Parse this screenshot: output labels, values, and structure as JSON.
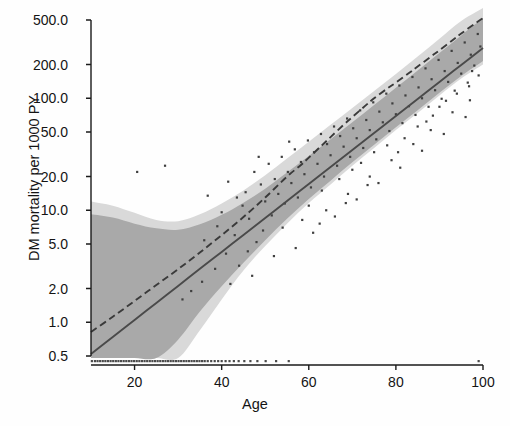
{
  "chart_data": {
    "type": "scatter",
    "title": "",
    "xlabel": "Age",
    "ylabel": "DM mortality per 1000 PY",
    "xlim": [
      10,
      100
    ],
    "ylim": [
      0.42,
      700
    ],
    "yscale": "log",
    "grid": false,
    "legend": null,
    "xticks": [
      20,
      40,
      60,
      80,
      100
    ],
    "xticklabels": [
      "20",
      "40",
      "60",
      "80",
      "100"
    ],
    "yticks": [
      0.5,
      1.0,
      2.0,
      5.0,
      10.0,
      20.0,
      50.0,
      100.0,
      200.0,
      500.0
    ],
    "yticklabels": [
      "0.5",
      "1.0",
      "2.0",
      "5.0",
      "10.0",
      "20.0",
      "50.0",
      "100.0",
      "200.0",
      "500.0"
    ],
    "series": [
      {
        "name": "linear-fit",
        "type": "line",
        "style": "solid",
        "color": "#4a4a4a",
        "x": [
          10,
          15,
          20,
          25,
          30,
          35,
          40,
          45,
          50,
          55,
          60,
          65,
          70,
          75,
          80,
          85,
          90,
          95,
          100
        ],
        "y": [
          0.52,
          0.74,
          1.05,
          1.49,
          2.11,
          3.0,
          4.25,
          6.03,
          8.55,
          12.1,
          17.2,
          24.4,
          34.6,
          49.1,
          69.6,
          98.7,
          140.0,
          198.5,
          281.5
        ]
      },
      {
        "name": "spline-fit",
        "type": "line",
        "style": "dashed",
        "color": "#3a3a3a",
        "x": [
          10,
          15,
          20,
          25,
          30,
          35,
          40,
          45,
          50,
          55,
          58,
          60,
          63,
          65,
          68,
          70,
          73,
          75,
          78,
          80,
          83,
          85,
          88,
          90,
          93,
          95,
          98,
          100
        ],
        "y": [
          0.82,
          1.12,
          1.55,
          2.15,
          2.98,
          4.2,
          6.0,
          8.7,
          13.0,
          20.0,
          25.0,
          29.5,
          38.0,
          45.0,
          58.0,
          68.0,
          86.0,
          100.0,
          122.0,
          138.0,
          168.0,
          192.0,
          235.0,
          268.0,
          330.0,
          378.0,
          460.0,
          520.0
        ]
      },
      {
        "name": "ci-band-outer",
        "type": "band",
        "color": "#d9d9d9",
        "x": [
          10,
          15,
          20,
          25,
          30,
          35,
          40,
          45,
          50,
          55,
          60,
          65,
          70,
          75,
          80,
          85,
          90,
          95,
          100
        ],
        "ylow": [
          0.42,
          0.42,
          0.42,
          0.42,
          0.45,
          0.85,
          1.6,
          2.9,
          4.8,
          7.6,
          11.6,
          17.0,
          25.0,
          36.0,
          52.0,
          74.0,
          106.0,
          150.0,
          200.0
        ],
        "yhigh": [
          12.0,
          11.0,
          9.5,
          8.2,
          8.0,
          9.2,
          11.5,
          15.0,
          20.5,
          29.0,
          41.0,
          58.0,
          82.0,
          116.0,
          165.0,
          236.0,
          340.0,
          490.0,
          700.0
        ]
      },
      {
        "name": "ci-band-inner",
        "type": "band",
        "color": "#a9a9a9",
        "x": [
          10,
          15,
          20,
          25,
          30,
          35,
          40,
          45,
          50,
          55,
          60,
          65,
          70,
          75,
          80,
          85,
          90,
          95,
          100
        ],
        "ylow": [
          0.42,
          0.42,
          0.42,
          0.42,
          0.7,
          1.25,
          2.1,
          3.4,
          5.4,
          8.4,
          12.6,
          18.4,
          26.8,
          38.5,
          55.0,
          78.0,
          112.0,
          158.0,
          215.0
        ],
        "yhigh": [
          9.2,
          8.6,
          7.6,
          6.9,
          6.7,
          7.5,
          9.1,
          11.7,
          15.6,
          21.8,
          30.5,
          43.0,
          61.0,
          87.0,
          124.0,
          177.0,
          254.0,
          364.0,
          520.0
        ]
      },
      {
        "name": "observations",
        "type": "scatter",
        "color": "#3f3f3f",
        "marker": "point",
        "points": [
          [
            20.6,
            22.0
          ],
          [
            27.0,
            25.0
          ],
          [
            36.8,
            13.5
          ],
          [
            39.0,
            7.2
          ],
          [
            40.0,
            9.6
          ],
          [
            41.5,
            18.0
          ],
          [
            43.0,
            6.0
          ],
          [
            44.8,
            11.0
          ],
          [
            45.5,
            14.5
          ],
          [
            46.3,
            8.4
          ],
          [
            47.5,
            22.0
          ],
          [
            48.0,
            5.2
          ],
          [
            49.0,
            17.0
          ],
          [
            50.0,
            12.0
          ],
          [
            50.8,
            26.0
          ],
          [
            51.5,
            9.0
          ],
          [
            52.2,
            19.0
          ],
          [
            53.0,
            14.0
          ],
          [
            53.8,
            30.0
          ],
          [
            54.5,
            11.5
          ],
          [
            55.2,
            22.0
          ],
          [
            56.0,
            17.5
          ],
          [
            56.8,
            35.0
          ],
          [
            57.5,
            13.0
          ],
          [
            58.2,
            27.0
          ],
          [
            59.0,
            21.0
          ],
          [
            59.8,
            42.0
          ],
          [
            60.5,
            16.0
          ],
          [
            61.2,
            33.0
          ],
          [
            62.0,
            26.0
          ],
          [
            62.8,
            48.0
          ],
          [
            63.5,
            20.0
          ],
          [
            64.2,
            39.0
          ],
          [
            65.0,
            31.0
          ],
          [
            65.8,
            56.0
          ],
          [
            66.5,
            25.0
          ],
          [
            67.2,
            46.0
          ],
          [
            68.0,
            37.0
          ],
          [
            68.8,
            66.0
          ],
          [
            69.5,
            30.0
          ],
          [
            70.2,
            54.0
          ],
          [
            71.0,
            44.0
          ],
          [
            71.8,
            78.0
          ],
          [
            72.5,
            36.0
          ],
          [
            73.2,
            64.0
          ],
          [
            74.0,
            52.0
          ],
          [
            74.8,
            92.0
          ],
          [
            75.5,
            43.0
          ],
          [
            76.2,
            76.0
          ],
          [
            77.0,
            61.0
          ],
          [
            77.8,
            110.0
          ],
          [
            78.5,
            51.0
          ],
          [
            79.2,
            90.0
          ],
          [
            80.0,
            72.0
          ],
          [
            80.8,
            130.0
          ],
          [
            81.5,
            60.0
          ],
          [
            82.2,
            106.0
          ],
          [
            83.0,
            85.0
          ],
          [
            83.8,
            155.0
          ],
          [
            84.5,
            71.0
          ],
          [
            85.2,
            125.0
          ],
          [
            86.0,
            100.0
          ],
          [
            86.8,
            185.0
          ],
          [
            87.5,
            84.0
          ],
          [
            88.2,
            148.0
          ],
          [
            89.0,
            118.0
          ],
          [
            89.8,
            220.0
          ],
          [
            90.5,
            99.0
          ],
          [
            91.2,
            175.0
          ],
          [
            92.0,
            140.0
          ],
          [
            92.8,
            265.0
          ],
          [
            93.5,
            117.0
          ],
          [
            94.2,
            207.0
          ],
          [
            95.0,
            166.0
          ],
          [
            95.8,
            315.0
          ],
          [
            96.5,
            138.0
          ],
          [
            97.2,
            245.0
          ],
          [
            98.0,
            196.0
          ],
          [
            98.8,
            375.0
          ],
          [
            99.4,
            290.0
          ],
          [
            44.0,
            3.2
          ],
          [
            47.0,
            2.6
          ],
          [
            52.0,
            3.9
          ],
          [
            57.0,
            4.6
          ],
          [
            61.0,
            6.3
          ],
          [
            66.0,
            8.8
          ],
          [
            71.0,
            12.5
          ],
          [
            76.0,
            17.5
          ],
          [
            81.0,
            24.0
          ],
          [
            86.0,
            34.0
          ],
          [
            91.0,
            48.0
          ],
          [
            96.0,
            68.0
          ],
          [
            88.0,
            52.0
          ],
          [
            93.0,
            75.0
          ],
          [
            97.0,
            96.0
          ],
          [
            84.0,
            39.0
          ],
          [
            79.0,
            28.0
          ],
          [
            74.0,
            20.0
          ],
          [
            69.0,
            14.0
          ],
          [
            64.0,
            10.0
          ],
          [
            41.0,
            4.1
          ],
          [
            38.5,
            3.0
          ],
          [
            35.5,
            2.3
          ],
          [
            33.0,
            1.9
          ],
          [
            58.5,
            8.2
          ],
          [
            63.0,
            15.0
          ],
          [
            67.0,
            19.0
          ],
          [
            72.0,
            26.5
          ],
          [
            78.0,
            38.0
          ],
          [
            82.0,
            44.0
          ],
          [
            87.0,
            62.0
          ],
          [
            94.0,
            110.0
          ],
          [
            99.0,
            160.0
          ],
          [
            42.0,
            2.2
          ],
          [
            46.0,
            4.3
          ],
          [
            54.0,
            7.0
          ],
          [
            49.5,
            6.6
          ],
          [
            60.0,
            11.0
          ],
          [
            70.0,
            23.0
          ],
          [
            75.0,
            33.0
          ],
          [
            85.0,
            56.0
          ],
          [
            90.0,
            84.0
          ],
          [
            96.8,
            128.0
          ],
          [
            43.5,
            13.0
          ],
          [
            48.5,
            30.0
          ],
          [
            55.5,
            41.0
          ],
          [
            62.5,
            7.6
          ],
          [
            68.5,
            11.6
          ],
          [
            73.5,
            16.8
          ],
          [
            80.5,
            33.0
          ],
          [
            88.5,
            70.0
          ],
          [
            91.5,
            95.0
          ],
          [
            97.5,
            175.0
          ],
          [
            36.0,
            5.4
          ],
          [
            31.0,
            1.6
          ]
        ]
      },
      {
        "name": "zero-rate-rug",
        "type": "scatter",
        "color": "#4a4a4a",
        "marker": "point",
        "y_constant": 0.45,
        "x": [
          10.2,
          10.9,
          11.5,
          12.1,
          12.7,
          13.3,
          13.9,
          14.5,
          15.1,
          15.7,
          16.3,
          16.9,
          17.5,
          18.1,
          18.7,
          19.3,
          19.9,
          20.5,
          21.1,
          21.7,
          22.3,
          22.9,
          23.5,
          24.1,
          24.7,
          25.3,
          25.9,
          26.5,
          27.1,
          27.7,
          28.3,
          28.9,
          29.5,
          30.1,
          30.7,
          31.3,
          31.9,
          32.5,
          33.1,
          33.7,
          34.3,
          34.9,
          35.5,
          36.1,
          36.8,
          37.6,
          38.4,
          39.2,
          40.0,
          40.9,
          41.8,
          42.8,
          43.9,
          45.2,
          46.6,
          48.2,
          50.1,
          52.5,
          55.4,
          99.0
        ]
      }
    ]
  },
  "axis": {
    "ylabel_text": "DM mortality per 1000 PY",
    "xlabel_text": "Age"
  }
}
